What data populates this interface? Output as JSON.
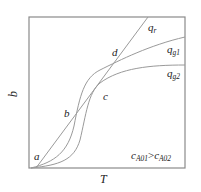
{
  "diagram": {
    "axes": {
      "x_label": "T",
      "y_label": "q"
    },
    "curves": [
      {
        "id": "qr",
        "label_main": "q",
        "label_sub": "r",
        "kind": "straight line"
      },
      {
        "id": "qg1",
        "label_main": "q",
        "label_sub": "g1",
        "kind": "S-curve"
      },
      {
        "id": "qg2",
        "label_main": "q",
        "label_sub": "g2",
        "kind": "S-curve"
      }
    ],
    "points": [
      {
        "id": "a",
        "label": "a"
      },
      {
        "id": "b",
        "label": "b"
      },
      {
        "id": "c",
        "label": "c"
      },
      {
        "id": "d",
        "label": "d"
      }
    ],
    "condition": {
      "left_main": "c",
      "left_sub": "A01",
      "op": ">",
      "right_main": "c",
      "right_sub": "A02"
    },
    "colors": {
      "frame": "#8a8a8a",
      "curves": "#9a9a9a",
      "text": "#222222"
    }
  }
}
